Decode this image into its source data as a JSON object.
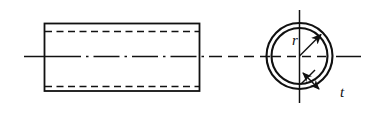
{
  "figure": {
    "background_color": "#ffffff",
    "line_color": "#111111",
    "views": [
      {
        "name": "side-view",
        "type": "rectangle-elevation",
        "description": "Longitudinal side view of tube with hidden bore lines",
        "rect": {
          "x": 44,
          "y": 23,
          "width": 156,
          "height": 68
        },
        "hidden_lines": [
          {
            "y": 31,
            "x1": 44,
            "x2": 200
          },
          {
            "y": 86,
            "x1": 44,
            "x2": 200
          }
        ]
      },
      {
        "name": "cross-section-view",
        "type": "concentric-circles",
        "description": "End cross section of tube showing wall thickness",
        "center": {
          "x": 299,
          "y": 56
        },
        "outer_radius": 33,
        "inner_radius": 28
      }
    ],
    "centerlines": {
      "horizontal": {
        "y": 56,
        "x1": 24,
        "x2": 361
      },
      "vertical": {
        "x": 299,
        "y1": 10,
        "y2": 103
      }
    },
    "dimensions": [
      {
        "name": "radius",
        "label": "r",
        "type": "radius-arrow",
        "from": {
          "x": 299,
          "y": 56
        },
        "to": {
          "x": 322,
          "y": 34
        },
        "label_position": {
          "x": 294,
          "y": 42
        }
      },
      {
        "name": "wall-thickness",
        "label": "t",
        "type": "thickness-double-arrow",
        "from": {
          "x": 306,
          "y": 76
        },
        "to": {
          "x": 316,
          "y": 86
        },
        "label_position": {
          "x": 344,
          "y": 92
        }
      }
    ]
  }
}
